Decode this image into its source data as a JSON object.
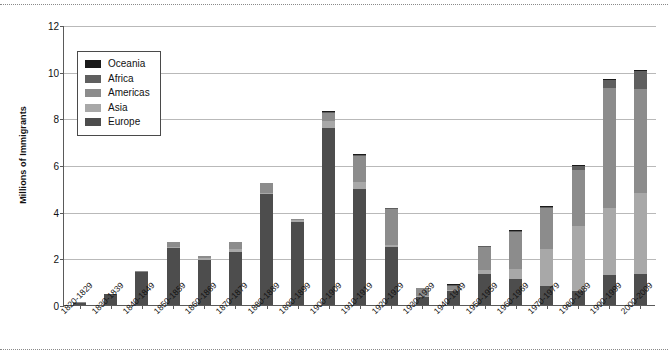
{
  "chart_data": {
    "type": "bar",
    "stacked": true,
    "title": "",
    "subtitle": "",
    "xlabel": "",
    "ylabel": "Millions of Immigrants",
    "ylim": [
      0,
      12
    ],
    "yticks": [
      0,
      2,
      4,
      6,
      8,
      10,
      12
    ],
    "ytick_labels": [
      "0",
      "2",
      "4",
      "6",
      "8",
      "10",
      "12"
    ],
    "grid": "horizontal",
    "legend_position": "upper-left-inside",
    "legend_entries": [
      "Oceania",
      "Africa",
      "Americas",
      "Asia",
      "Europe"
    ],
    "categories": [
      "1820-1829",
      "1830-1839",
      "1840-1849",
      "1850-1859",
      "1860-1869",
      "1870-1879",
      "1880-1889",
      "1890-1899",
      "1900-1909",
      "1910-1919",
      "1920-1929",
      "1930-1939",
      "1940-1949",
      "1950-1959",
      "1960-1969",
      "1970-1979",
      "1980-1989",
      "1990-1999",
      "2000-2009"
    ],
    "series": [
      {
        "name": "Europe",
        "color": "#4d4d4d",
        "values": [
          0.1,
          0.48,
          1.42,
          2.45,
          1.95,
          2.27,
          4.74,
          3.56,
          7.57,
          4.99,
          2.48,
          0.35,
          0.62,
          1.33,
          1.12,
          0.8,
          0.58,
          1.3,
          1.35
        ]
      },
      {
        "name": "Asia",
        "color": "#a8a8a8",
        "values": [
          0.0,
          0.0,
          0.0,
          0.04,
          0.06,
          0.12,
          0.07,
          0.07,
          0.3,
          0.27,
          0.11,
          0.02,
          0.04,
          0.15,
          0.43,
          1.59,
          2.8,
          2.85,
          3.47
        ]
      },
      {
        "name": "Americas",
        "color": "#8c8c8c",
        "values": [
          0.01,
          0.0,
          0.01,
          0.22,
          0.1,
          0.32,
          0.43,
          0.04,
          0.36,
          1.14,
          1.52,
          0.35,
          0.16,
          1.0,
          1.6,
          1.75,
          2.4,
          5.14,
          4.44
        ]
      },
      {
        "name": "Africa",
        "color": "#5f5f5f",
        "values": [
          0.0,
          0.0,
          0.0,
          0.0,
          0.0,
          0.0,
          0.0,
          0.0,
          0.01,
          0.01,
          0.02,
          0.0,
          0.01,
          0.01,
          0.03,
          0.08,
          0.18,
          0.35,
          0.76
        ]
      },
      {
        "name": "Oceania",
        "color": "#1a1a1a",
        "values": [
          0.0,
          0.0,
          0.0,
          0.0,
          0.0,
          0.0,
          0.0,
          0.0,
          0.01,
          0.01,
          0.01,
          0.0,
          0.01,
          0.01,
          0.02,
          0.02,
          0.04,
          0.06,
          0.07
        ]
      }
    ],
    "totals": [
      0.11,
      0.48,
      1.43,
      2.71,
      2.11,
      2.71,
      5.24,
      3.67,
      8.25,
      6.42,
      4.14,
      0.72,
      0.84,
      2.5,
      3.2,
      4.24,
      6.0,
      9.7,
      10.09
    ]
  },
  "colors": {
    "axis": "#5a5a5a",
    "grid": "#b9b9b9",
    "text": "#111111",
    "background": "#ffffff",
    "rule": "#8a8a8a"
  }
}
